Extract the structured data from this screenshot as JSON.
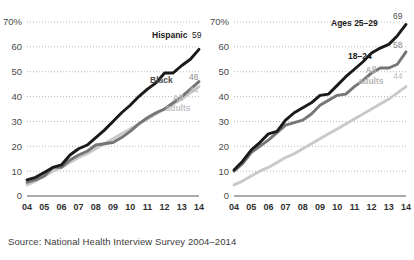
{
  "source_note": "Source: National Health Interview Survey 2004–2014",
  "axis": {
    "y_ticks": [
      "70%",
      "60",
      "50",
      "40",
      "30",
      "20",
      "10",
      "0"
    ],
    "y_values": [
      70,
      60,
      50,
      40,
      30,
      20,
      10,
      0
    ],
    "x_ticks": [
      "04",
      "05",
      "06",
      "07",
      "08",
      "09",
      "10",
      "11",
      "12",
      "13",
      "14"
    ],
    "ylim": [
      0,
      70
    ],
    "grid": "dotted-horizontal"
  },
  "colors": {
    "dark": "#1a1a1a",
    "mid": "#757575",
    "light": "#c9c9c9",
    "grid": "#9a9a9a",
    "axis": "#8f8f8f",
    "text": "#231f20"
  },
  "chart_data": [
    {
      "type": "line",
      "title": "",
      "xlabel": "",
      "ylabel": "",
      "ylim": [
        0,
        70
      ],
      "grid": true,
      "legend": "inline-end-labels",
      "x": [
        2004,
        2004.5,
        2005,
        2005.5,
        2006,
        2006.5,
        2007,
        2007.5,
        2008,
        2008.5,
        2009,
        2009.5,
        2010,
        2010.5,
        2011,
        2011.5,
        2012,
        2012.5,
        2013,
        2013.5,
        2014
      ],
      "categories": [
        "04",
        "05",
        "06",
        "07",
        "08",
        "09",
        "10",
        "11",
        "12",
        "13",
        "14"
      ],
      "series": [
        {
          "name": "Hispanic",
          "color": "#1a1a1a",
          "end_label": "Hispanic",
          "end_value": 59,
          "values": [
            6.5,
            7.5,
            9.5,
            11.5,
            12.5,
            16.5,
            19.0,
            20.5,
            23.5,
            26.5,
            30.0,
            33.5,
            36.5,
            40.0,
            43.0,
            45.5,
            49.5,
            49.5,
            52.5,
            55.0,
            59
          ]
        },
        {
          "name": "Black",
          "color": "#757575",
          "end_label": "Black",
          "end_value": 46,
          "values": [
            5.5,
            6.5,
            8.0,
            11.5,
            11.5,
            14.5,
            16.5,
            18.0,
            20.5,
            21.0,
            21.5,
            23.5,
            26.0,
            29.0,
            31.5,
            33.5,
            35.0,
            37.5,
            40.0,
            43.0,
            46
          ]
        },
        {
          "name": "All adults",
          "color": "#c9c9c9",
          "end_label": "All adults",
          "end_value": 44,
          "values": [
            4.5,
            6.0,
            8.0,
            10.0,
            11.5,
            13.5,
            15.5,
            17.0,
            19.0,
            21.0,
            23.0,
            25.0,
            27.0,
            29.0,
            31.0,
            33.0,
            35.0,
            37.0,
            39.0,
            41.5,
            44
          ]
        }
      ]
    },
    {
      "type": "line",
      "title": "",
      "xlabel": "",
      "ylabel": "",
      "ylim": [
        0,
        70
      ],
      "grid": true,
      "legend": "inline-end-labels",
      "x": [
        2004,
        2004.5,
        2005,
        2005.5,
        2006,
        2006.5,
        2007,
        2007.5,
        2008,
        2008.5,
        2009,
        2009.5,
        2010,
        2010.5,
        2011,
        2011.5,
        2012,
        2012.5,
        2013,
        2013.5,
        2014
      ],
      "categories": [
        "04",
        "05",
        "06",
        "07",
        "08",
        "09",
        "10",
        "11",
        "12",
        "13",
        "14"
      ],
      "series": [
        {
          "name": "Ages 25–29",
          "color": "#1a1a1a",
          "end_label": "Ages 25–29",
          "end_value": 69,
          "values": [
            10.5,
            14.0,
            18.5,
            21.5,
            25.0,
            26.0,
            30.5,
            33.5,
            35.5,
            37.5,
            40.5,
            41.0,
            44.5,
            48.0,
            51.0,
            54.0,
            57.5,
            59.5,
            61.0,
            64.5,
            69
          ]
        },
        {
          "name": "18–24",
          "color": "#757575",
          "end_label": "18–24",
          "end_value": 58,
          "values": [
            10.0,
            13.0,
            17.5,
            20.0,
            22.5,
            25.5,
            28.5,
            29.5,
            30.5,
            33.0,
            36.5,
            38.5,
            40.5,
            41.0,
            44.0,
            46.5,
            49.5,
            51.5,
            51.5,
            53.0,
            58
          ]
        },
        {
          "name": "All adults",
          "color": "#c9c9c9",
          "end_label": "All adults",
          "end_value": 44,
          "values": [
            4.5,
            6.0,
            8.0,
            10.0,
            11.5,
            13.5,
            15.5,
            17.0,
            19.0,
            21.0,
            23.0,
            25.0,
            27.0,
            29.0,
            31.0,
            33.0,
            35.0,
            37.0,
            39.0,
            41.5,
            44
          ]
        }
      ]
    }
  ],
  "panels": [
    {
      "id": "panel-left",
      "labels": [
        {
          "name": "hispanic-label",
          "text": "Hispanic",
          "x": 152,
          "y": 38,
          "color": "#1a1a1a",
          "bold": true,
          "anchor": "start"
        },
        {
          "name": "hispanic-value",
          "text": "59",
          "x": 192,
          "y": 38,
          "color": "#1a1a1a",
          "bold": false,
          "anchor": "start"
        },
        {
          "name": "black-label",
          "text": "Black",
          "x": 150,
          "y": 83,
          "color": "#4d4d4d",
          "bold": true,
          "anchor": "start"
        },
        {
          "name": "black-value",
          "text": "46",
          "x": 189,
          "y": 80,
          "color": "#8a8a8a",
          "bold": false,
          "anchor": "start"
        },
        {
          "name": "all-adults-value",
          "text": "44",
          "x": 189,
          "y": 93,
          "color": "#bdbdbd",
          "bold": false,
          "anchor": "start"
        },
        {
          "name": "all-adults-label-1",
          "text": "All",
          "x": 178,
          "y": 101,
          "color": "#c2c2c2",
          "bold": true,
          "anchor": "middle"
        },
        {
          "name": "all-adults-label-2",
          "text": "adults",
          "x": 178,
          "y": 111,
          "color": "#c2c2c2",
          "bold": true,
          "anchor": "middle"
        }
      ]
    },
    {
      "id": "panel-right",
      "labels": [
        {
          "name": "ages-25-29-label",
          "text": "Ages 25–29",
          "x": 124,
          "y": 26,
          "color": "#1a1a1a",
          "bold": true,
          "anchor": "start"
        },
        {
          "name": "ages-25-29-value",
          "text": "69",
          "x": 186,
          "y": 19,
          "color": "#4d4d4d",
          "bold": false,
          "anchor": "start"
        },
        {
          "name": "ages-18-24-label",
          "text": "18–24",
          "x": 141,
          "y": 59,
          "color": "#1a1a1a",
          "bold": true,
          "anchor": "start"
        },
        {
          "name": "ages-18-24-value",
          "text": "58",
          "x": 186,
          "y": 48,
          "color": "#8a8a8a",
          "bold": false,
          "anchor": "start"
        },
        {
          "name": "all-adults-value-right",
          "text": "44",
          "x": 186,
          "y": 79,
          "color": "#bdbdbd",
          "bold": false,
          "anchor": "start"
        },
        {
          "name": "all-adults-label-right-1",
          "text": "All",
          "x": 164,
          "y": 73,
          "color": "#b5b5b5",
          "bold": true,
          "anchor": "middle"
        },
        {
          "name": "all-adults-label-right-2",
          "text": "adults",
          "x": 164,
          "y": 84,
          "color": "#b5b5b5",
          "bold": true,
          "anchor": "middle"
        }
      ]
    }
  ]
}
